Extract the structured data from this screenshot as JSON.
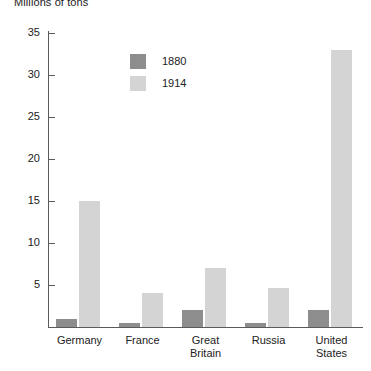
{
  "chart_data": {
    "type": "bar",
    "title": "Millions of tons",
    "xlabel": "",
    "ylabel": "",
    "ylim": [
      0,
      37
    ],
    "yticks": [
      5,
      10,
      15,
      20,
      25,
      30,
      35
    ],
    "grid": false,
    "legend_position": "upper-center-left",
    "categories": [
      "Germany",
      "France",
      "Great Britain",
      "Russia",
      "United States"
    ],
    "category_lines": [
      [
        "Germany"
      ],
      [
        "France"
      ],
      [
        "Great",
        "Britain"
      ],
      [
        "Russia"
      ],
      [
        "United",
        "States"
      ]
    ],
    "series": [
      {
        "name": "1880",
        "color": "#8d8d8d",
        "values": [
          1.0,
          0.5,
          2.0,
          0.5,
          2.0
        ]
      },
      {
        "name": "1914",
        "color": "#d4d4d4",
        "values": [
          15.0,
          4.0,
          7.0,
          4.6,
          33.0
        ]
      }
    ]
  },
  "axis": {
    "tick_labels": [
      "35",
      "30",
      "25",
      "20",
      "15",
      "10",
      "5"
    ]
  },
  "legend": {
    "entries": [
      {
        "label": "1880",
        "color": "#8d8d8d"
      },
      {
        "label": "1914",
        "color": "#d4d4d4"
      }
    ]
  }
}
